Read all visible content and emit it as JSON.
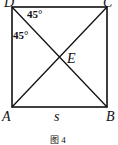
{
  "figure": {
    "caption": "图 4",
    "vertices": {
      "A": {
        "label": "A",
        "x": 12,
        "y": 107
      },
      "B": {
        "label": "B",
        "x": 107,
        "y": 107
      },
      "C": {
        "label": "C",
        "x": 107,
        "y": 7
      },
      "D": {
        "label": "D",
        "x": 12,
        "y": 7
      }
    },
    "intersection": {
      "label": "E",
      "x": 59.5,
      "y": 57
    },
    "side_label": "s",
    "angles": [
      {
        "label": "45°",
        "at": "D",
        "between": "DC-DB"
      },
      {
        "label": "45°",
        "at": "D",
        "between": "DA-DB"
      }
    ],
    "line_color": "#111111"
  }
}
